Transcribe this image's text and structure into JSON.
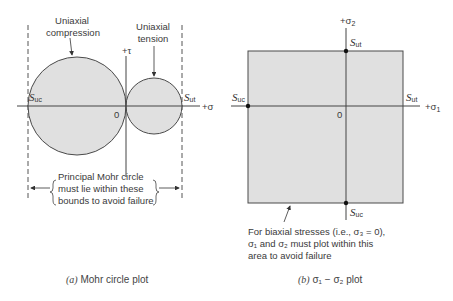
{
  "colors": {
    "fill": "#e0e0e0",
    "stroke": "#4a4a4a",
    "text": "#3a3a3a",
    "background": "#ffffff"
  },
  "panel_a": {
    "label_compression_1": "Uniaxial",
    "label_compression_2": "compression",
    "label_tension_1": "Uniaxial",
    "label_tension_2": "tension",
    "tau_axis_label": "+τ",
    "sigma_axis_label": "+σ",
    "origin_label": "0",
    "suc_main": "S",
    "suc_sub": "uc",
    "sut_main": "S",
    "sut_sub": "ut",
    "bound_note_1": "Principal Mohr circle",
    "bound_note_2": "must lie within these",
    "bound_note_3": "bounds to avoid failure",
    "caption_prefix": "(a)",
    "caption_text": " Mohr circle plot"
  },
  "panel_b": {
    "sigma2_label": "+σ",
    "sigma2_sub": "2",
    "sigma1_label": "+σ",
    "sigma1_sub": "1",
    "origin_label": "0",
    "sut_top_main": "S",
    "sut_top_sub": "ut",
    "sut_right_main": "S",
    "sut_right_sub": "ut",
    "suc_left_main": "S",
    "suc_left_sub": "uc",
    "suc_bottom_main": "S",
    "suc_bottom_sub": "uc",
    "note_1": "For biaxial stresses (i.e., σ₃ = 0),",
    "note_2": "σ₁ and σ₂ must plot within this",
    "note_3": "area to avoid failure",
    "caption_prefix": "(b)",
    "caption_text": " σ₁ − σ₂ plot"
  }
}
